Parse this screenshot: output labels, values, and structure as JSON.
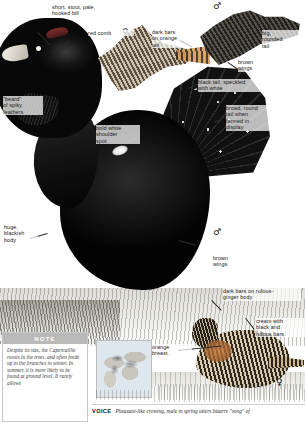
{
  "page": {
    "width": 305,
    "height": 422
  },
  "symbols": {
    "male": "♂",
    "female": "♀"
  },
  "annotations": [
    {
      "id": "bill",
      "text": "short, stout, pale,\nhooked bill"
    },
    {
      "id": "comb",
      "text": "red comb"
    },
    {
      "id": "beard",
      "text": "\"beard\"\nof spiky\nfeathers"
    },
    {
      "id": "shoulder",
      "text": "bold white\nshoulder\nspot"
    },
    {
      "id": "body",
      "text": "huge,\nblackish\nbody"
    },
    {
      "id": "dark-bars-tail",
      "text": "dark bars\non orange\ntail"
    },
    {
      "id": "rounded-tail",
      "text": "big,\nrounded\ntail"
    },
    {
      "id": "brown-wings-top",
      "text": "brown\nwings"
    },
    {
      "id": "black-tail",
      "text": "black tail, speckled\nwith white"
    },
    {
      "id": "fanned-tail",
      "text": "broad, round\ntail when\nfanned in\ndisplay"
    },
    {
      "id": "brown-wings-mid",
      "text": "brown\nwings."
    },
    {
      "id": "rufous-body",
      "text": "dark bars on rufous-\nginger body"
    },
    {
      "id": "cream-bars",
      "text": "cream with\nblack and\nrufous bars."
    },
    {
      "id": "orange-breast",
      "text": "orange\nbreast."
    }
  ],
  "note": {
    "header": "NOTE",
    "body": "Despite its size, the Capercaillie roosts in the trees, and often feeds up in the branches in winter. In summer, it is more likely to be found at ground level. It rarely allows"
  },
  "voice": {
    "label": "VOICE",
    "text": "Pheasant-like crowing, male in spring utters bizarre \"song\" of"
  },
  "colors": {
    "note_header_bg": "#b9b9b9",
    "ink": "#1a1a1a",
    "red_comb": "#8a3431",
    "orange_breast": "#c4763a"
  }
}
